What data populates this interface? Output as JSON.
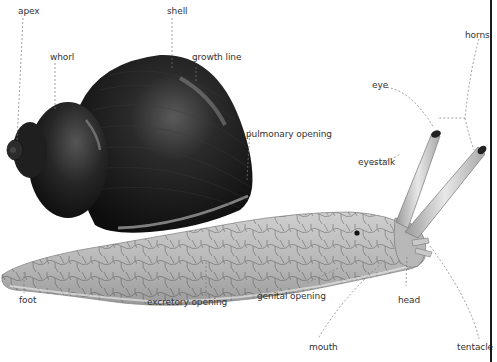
{
  "diagram": {
    "labels": {
      "apex": "apex",
      "shell": "shell",
      "whorl": "whorl",
      "growth_line": "growth line",
      "pulmonary_opening": "pulmonary opening",
      "eye": "eye",
      "horns": "horns",
      "eyestalk": "eyestalk",
      "foot": "foot",
      "excretory_opening": "excretory opening",
      "genital_opening": "genital opening",
      "head": "head",
      "mouth": "mouth",
      "tentacle": "tentacle"
    },
    "colors": {
      "shell": "#1c1c1c",
      "body": "#bdbdbd",
      "leader_line": "#777777",
      "label_text": "#333333",
      "border": "#1a1a1a"
    }
  }
}
